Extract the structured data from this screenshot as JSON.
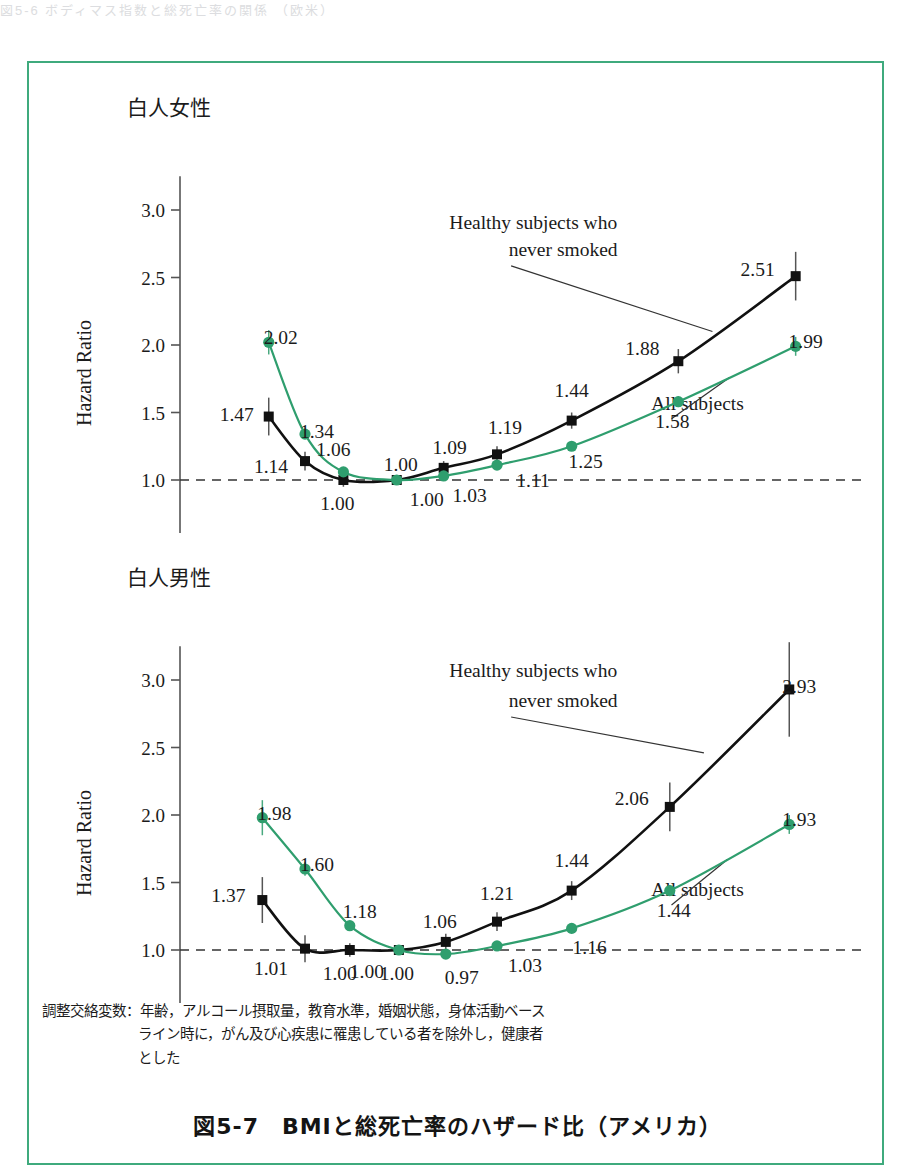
{
  "page": {
    "top_fragment": "図5-6  ボディマス指数と総死亡率の関係 （欧米）",
    "frame_color": "#3faa7d"
  },
  "figure": {
    "caption_line1": "調整交絡変数：年齢，アルコール摂取量，教育水準，婚姻状態，身体活動ベース",
    "caption_line2": "ライン時に，がん及び心疾患に罹患している者を除外し，健康者",
    "caption_line3": "とした",
    "title": "図5-7　BMIと総死亡率のハザード比（アメリカ）"
  },
  "series_colors": {
    "healthy_never_smoked": "#111111",
    "all_subjects": "#2f9e6e",
    "reference_line": "#333333"
  },
  "chart_data": [
    {
      "type": "line",
      "title": "白人女性",
      "xlabel": "Body-Mass Index",
      "ylabel": "Hazard Ratio",
      "xlim": [
        15.0,
        45.0
      ],
      "ylim": [
        0.5,
        3.2
      ],
      "xticks": [
        "0.0",
        "15.0",
        "17.5",
        "20.0",
        "22.5",
        "25.0",
        "27.5",
        "30.0",
        "32.5",
        "35.0",
        "37.5",
        "40.0",
        "42.5",
        "45.0"
      ],
      "yticks": [
        "0.5",
        "1.0",
        "1.5",
        "2.0",
        "2.5",
        "3.0"
      ],
      "axis_break": true,
      "reference_value": 1.0,
      "grid": false,
      "legend": [
        "Healthy subjects who never smoked",
        "All subjects"
      ],
      "annotations": [
        {
          "text": "Healthy subjects who",
          "x": 30.2,
          "y": 2.86
        },
        {
          "text": "never smoked",
          "x": 31.6,
          "y": 2.66
        },
        {
          "text": "All subjects",
          "x": 37.9,
          "y": 1.52
        }
      ],
      "x": [
        17.8,
        19.5,
        21.3,
        23.8,
        26.0,
        28.5,
        32.0,
        37.0,
        42.5
      ],
      "series": [
        {
          "name": "Healthy subjects who never smoked",
          "color": "#111111",
          "marker": "square",
          "values": [
            1.47,
            1.14,
            1.0,
            1.0,
            1.09,
            1.19,
            1.44,
            1.88,
            2.51
          ],
          "labels": [
            "1.47",
            "1.14",
            "1.00",
            "1.00",
            "1.09",
            "1.19",
            "1.44",
            "1.88",
            "2.51"
          ],
          "errbar": [
            0.14,
            0.07,
            0.05,
            0.0,
            0.05,
            0.06,
            0.06,
            0.09,
            0.18
          ]
        },
        {
          "name": "All subjects",
          "color": "#2f9e6e",
          "marker": "circle",
          "values": [
            2.02,
            1.34,
            1.06,
            1.0,
            1.03,
            1.11,
            1.25,
            1.58,
            1.99
          ],
          "labels": [
            "2.02",
            "1.34",
            "1.06",
            "1.00",
            "1.03",
            "1.11",
            "1.25",
            "1.58",
            "1.99"
          ],
          "errbar": [
            0.09,
            0.0,
            0.0,
            0.0,
            0.0,
            0.0,
            0.0,
            0.04,
            0.07
          ]
        }
      ]
    },
    {
      "type": "line",
      "title": "白人男性",
      "xlabel": "Body-Mass Index",
      "ylabel": "Hazard Ratio",
      "xlim": [
        15.0,
        45.0
      ],
      "ylim": [
        0.5,
        3.2
      ],
      "xticks": [
        "0.0",
        "15.0",
        "17.5",
        "20.0",
        "22.5",
        "25.0",
        "27.5",
        "30.0",
        "32.5",
        "35.0",
        "37.5",
        "40.0",
        "42.5",
        "45.0"
      ],
      "yticks": [
        "0.5",
        "1.0",
        "1.5",
        "2.0",
        "2.5",
        "3.0"
      ],
      "axis_break": true,
      "reference_value": 1.0,
      "grid": false,
      "legend": [
        "Healthy subjects who never smoked",
        "All subjects"
      ],
      "annotations": [
        {
          "text": "Healthy subjects who",
          "x": 30.2,
          "y": 3.02
        },
        {
          "text": "never smoked",
          "x": 31.6,
          "y": 2.8
        },
        {
          "text": "All subjects",
          "x": 37.9,
          "y": 1.4
        }
      ],
      "x": [
        17.5,
        19.5,
        21.6,
        23.9,
        26.1,
        28.5,
        32.0,
        36.6,
        42.2
      ],
      "series": [
        {
          "name": "Healthy subjects who never smoked",
          "color": "#111111",
          "marker": "square",
          "values": [
            1.37,
            1.01,
            1.0,
            1.0,
            1.06,
            1.21,
            1.44,
            2.06,
            2.93
          ],
          "labels": [
            "1.37",
            "1.01",
            "1.00",
            "1.00",
            "1.06",
            "1.21",
            "1.44",
            "2.06",
            "2.93"
          ],
          "errbar": [
            0.17,
            0.1,
            0.05,
            0.03,
            0.06,
            0.07,
            0.07,
            0.18,
            0.35
          ]
        },
        {
          "name": "All subjects",
          "color": "#2f9e6e",
          "marker": "circle",
          "values": [
            1.98,
            1.6,
            1.18,
            1.0,
            0.97,
            1.03,
            1.16,
            1.44,
            1.93
          ],
          "labels": [
            "1.98",
            "1.60",
            "1.18",
            "1.00",
            "0.97",
            "1.03",
            "1.16",
            "1.44",
            "1.93"
          ],
          "errbar": [
            0.13,
            0.05,
            0.0,
            0.0,
            0.0,
            0.0,
            0.0,
            0.04,
            0.07
          ]
        }
      ]
    }
  ]
}
